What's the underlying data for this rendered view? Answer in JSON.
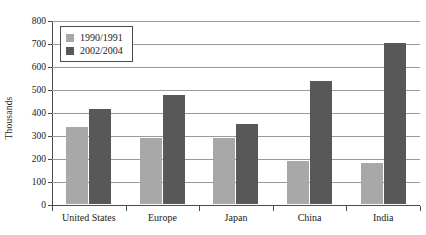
{
  "chart_data": {
    "type": "bar",
    "title": "",
    "subtitle": "",
    "xlabel": "",
    "ylabel": "Thousands",
    "ylim": [
      0,
      800
    ],
    "ytick_step": 100,
    "yticks": [
      "0",
      "100",
      "200",
      "300",
      "400",
      "500",
      "600",
      "700",
      "800"
    ],
    "grid": true,
    "legend_position": "upper-left-inside",
    "categories": [
      "United States",
      "Europe",
      "Japan",
      "China",
      "India"
    ],
    "series": [
      {
        "name": "1990/1991",
        "color": "#a8a8a8",
        "values": [
          335,
          285,
          285,
          185,
          180
        ]
      },
      {
        "name": "2002/2004",
        "color": "#585858",
        "values": [
          415,
          475,
          350,
          535,
          700
        ]
      }
    ]
  },
  "legend": {
    "entries": [
      {
        "label": "1990/1991"
      },
      {
        "label": "2002/2004"
      }
    ]
  },
  "colors": {
    "series_1990": "#a8a8a8",
    "series_2002": "#585858",
    "axis": "#4a4a4a",
    "grid": "#9a9a9a",
    "background": "#ffffff"
  }
}
